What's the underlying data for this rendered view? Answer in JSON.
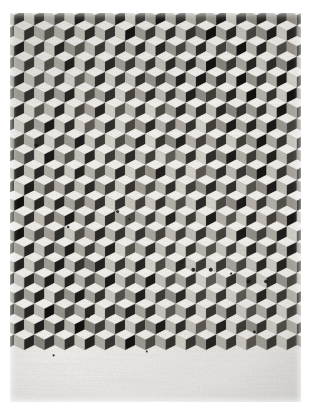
{
  "image": {
    "kind": "photograph",
    "subject": "tumbling-blocks isometric cube tessellation",
    "medium": "black-and-white print on white paper",
    "alt_text": "Monochrome photograph of a repeating isometric cube (tumbling blocks) pattern; light rhombic top faces with randomly varying mid-gray and near-black side faces.",
    "canvas": {
      "width": 310,
      "height": 415,
      "background": "#ffffff"
    },
    "plate": {
      "x": 10,
      "y": 13,
      "width": 291,
      "height": 389
    },
    "margins": {
      "left": 10,
      "top": 13,
      "right": 9,
      "bottom": 13
    }
  },
  "palette": {
    "paper": "#ffffff",
    "plate_base": "#f2f1ee",
    "top_face_light": "#f6f5f2",
    "top_face_mid": "#e3e1db",
    "left_face_light": "#d8d5cd",
    "left_face_mid": "#a9a59c",
    "left_face_dark": "#6e6a62",
    "right_face_mid": "#6b675f",
    "right_face_dark": "#2a2724",
    "right_face_black": "#121110",
    "edge_line": "#8d8980",
    "speck": "#1a1815"
  },
  "pattern": {
    "type": "isometric-cube-tessellation",
    "cube_width_px": 20.2,
    "cube_height_px": 20.6,
    "columns": 15,
    "rows": 20,
    "row_offset_px": 10.1,
    "face_count_per_cube": 3,
    "face_names": [
      "top",
      "left",
      "right"
    ],
    "tone_variation": "random per-face grayscale, biased light on top faces and dark on right faces",
    "notes": "slight lighter diagonal band from upper-left to lower-right center; scattered dark round specks concentrated lower-right"
  },
  "tones": {
    "top": [
      0.97,
      0.93,
      0.99,
      0.9,
      0.96,
      0.88,
      0.99,
      0.94,
      0.86,
      0.98,
      0.91,
      0.97,
      0.84,
      0.95,
      0.99,
      0.89,
      0.93,
      0.98,
      0.87,
      0.96
    ],
    "left": [
      0.74,
      0.55,
      0.82,
      0.41,
      0.68,
      0.88,
      0.35,
      0.6,
      0.79,
      0.47,
      0.85,
      0.29,
      0.71,
      0.52,
      0.9,
      0.44,
      0.66,
      0.8,
      0.38,
      0.57
    ],
    "right": [
      0.12,
      0.34,
      0.07,
      0.52,
      0.19,
      0.41,
      0.05,
      0.28,
      0.6,
      0.14,
      0.37,
      0.09,
      0.46,
      0.22,
      0.55,
      0.1,
      0.31,
      0.17,
      0.48,
      0.25
    ]
  },
  "specks": [
    {
      "x": 0.09,
      "y": 0.34,
      "r": 1.8
    },
    {
      "x": 0.2,
      "y": 0.55,
      "r": 1.2
    },
    {
      "x": 0.37,
      "y": 0.51,
      "r": 1.5
    },
    {
      "x": 0.41,
      "y": 0.53,
      "r": 1.0
    },
    {
      "x": 0.27,
      "y": 0.78,
      "r": 1.3
    },
    {
      "x": 0.63,
      "y": 0.66,
      "r": 2.0
    },
    {
      "x": 0.69,
      "y": 0.66,
      "r": 1.9
    },
    {
      "x": 0.76,
      "y": 0.67,
      "r": 1.1
    },
    {
      "x": 0.82,
      "y": 0.69,
      "r": 2.1
    },
    {
      "x": 0.88,
      "y": 0.69,
      "r": 1.9
    },
    {
      "x": 0.59,
      "y": 0.64,
      "r": 1.0
    },
    {
      "x": 0.84,
      "y": 0.82,
      "r": 1.4
    },
    {
      "x": 0.15,
      "y": 0.88,
      "r": 1.1
    },
    {
      "x": 0.47,
      "y": 0.87,
      "r": 1.0
    }
  ],
  "seed": 20240517
}
